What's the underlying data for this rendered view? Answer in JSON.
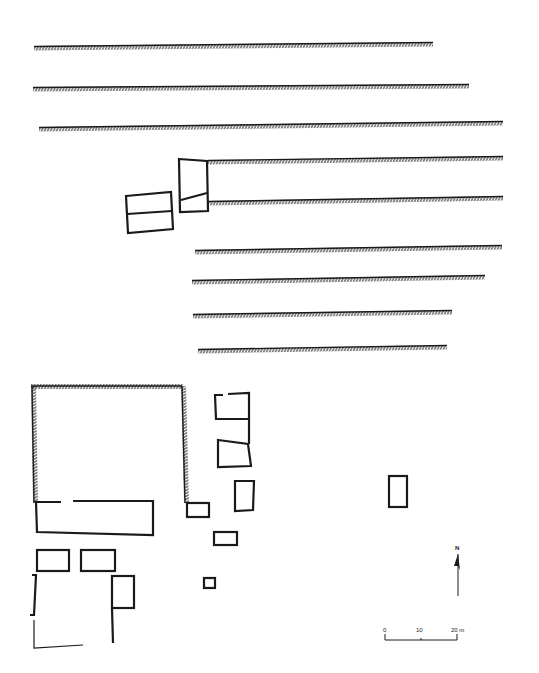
{
  "figure": {
    "type": "archaeological site plan",
    "background": "#ffffff",
    "ink": "#1a1a1a"
  },
  "walls_hatched": [
    {
      "x1": 34,
      "y1": 47,
      "x2": 433,
      "y2": 43
    },
    {
      "x1": 33,
      "y1": 88,
      "x2": 469,
      "y2": 85
    },
    {
      "x1": 39,
      "y1": 128,
      "x2": 503,
      "y2": 122
    },
    {
      "x1": 208,
      "y1": 161,
      "x2": 503,
      "y2": 157
    },
    {
      "x1": 208,
      "y1": 202,
      "x2": 503,
      "y2": 197
    },
    {
      "x1": 195,
      "y1": 251,
      "x2": 502,
      "y2": 246
    },
    {
      "x1": 192,
      "y1": 281,
      "x2": 485,
      "y2": 276
    },
    {
      "x1": 193,
      "y1": 315,
      "x2": 452,
      "y2": 311
    },
    {
      "x1": 198,
      "y1": 350,
      "x2": 447,
      "y2": 346
    }
  ],
  "enclosure": {
    "top_left": [
      32,
      387
    ],
    "top_right": [
      182,
      387
    ],
    "bottom_left": [
      34,
      502
    ],
    "bottom_right": [
      187,
      502
    ]
  },
  "north_arrow": {
    "label": "N",
    "x": 457,
    "y": 548
  },
  "scale_bar": {
    "ticks": [
      "0",
      "10",
      "20 m"
    ],
    "x_start": 385,
    "x_end": 457,
    "y": 640
  }
}
